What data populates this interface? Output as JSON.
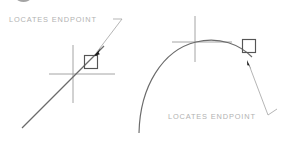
{
  "figure": {
    "width": 285,
    "height": 157,
    "background_color": "#ffffff"
  },
  "colors": {
    "text": "#b2b2b2",
    "geometry_line": "#6b6b6b",
    "crosshair": "#9a9a9a",
    "marker_stroke": "#555555",
    "leader_line": "#a8a8a8",
    "arrowhead": "#1a1a1a",
    "crop_glyph": "#5a5a5a"
  },
  "panels": [
    {
      "id": "left-panel",
      "name": "line-endpoint-panel",
      "geometry_type": "line",
      "callout": {
        "label": "LOCATES  ENDPOINT",
        "text_x": 9,
        "text_y": 16,
        "leader_tail": {
          "x1": 113,
          "y1": 19,
          "x2": 122,
          "y2": 19
        },
        "leader_path": {
          "x1": 122,
          "y1": 19,
          "x2": 97,
          "y2": 51
        },
        "arrow_tip": {
          "x": 94,
          "y": 56
        },
        "arrow_angle_deg": 232
      },
      "geometry": {
        "line": {
          "x1": 22,
          "y1": 128,
          "x2": 104,
          "y2": 46
        }
      },
      "crosshair": {
        "center_x": 73,
        "center_y": 74,
        "vertical": {
          "x": 73,
          "y1": 45,
          "y2": 103
        },
        "horizontal": {
          "y": 74,
          "x1": 49,
          "x2": 115
        }
      },
      "snap_marker": {
        "type": "square",
        "center_x": 91,
        "center_y": 62,
        "size": 13
      }
    },
    {
      "id": "right-panel",
      "name": "arc-endpoint-panel",
      "geometry_type": "arc",
      "callout": {
        "label": "LOCATES  ENDPOINT",
        "text_x": 168,
        "text_y": 113,
        "leader_tail": {
          "x1": 268,
          "y1": 115,
          "x2": 277,
          "y2": 110
        },
        "leader_path": {
          "x1": 268,
          "y1": 115,
          "x2": 250,
          "y2": 67
        },
        "arrow_tip": {
          "x": 247,
          "y": 60
        },
        "arrow_angle_deg": 289
      },
      "geometry": {
        "arc_path": "M 139,133 C 140,86 163,50 196,42 C 220,36 240,45 252,57"
      },
      "crosshair": {
        "center_x": 195,
        "center_y": 42,
        "vertical": {
          "x": 195,
          "y1": 16,
          "y2": 62
        },
        "horizontal": {
          "y": 42,
          "x1": 172,
          "x2": 232
        }
      },
      "snap_marker": {
        "type": "square",
        "center_x": 249,
        "center_y": 46,
        "size": 13
      }
    }
  ],
  "artifacts": {
    "top_crop_glyph": {
      "name": "cropped-heading-glyph",
      "visible": true
    }
  }
}
